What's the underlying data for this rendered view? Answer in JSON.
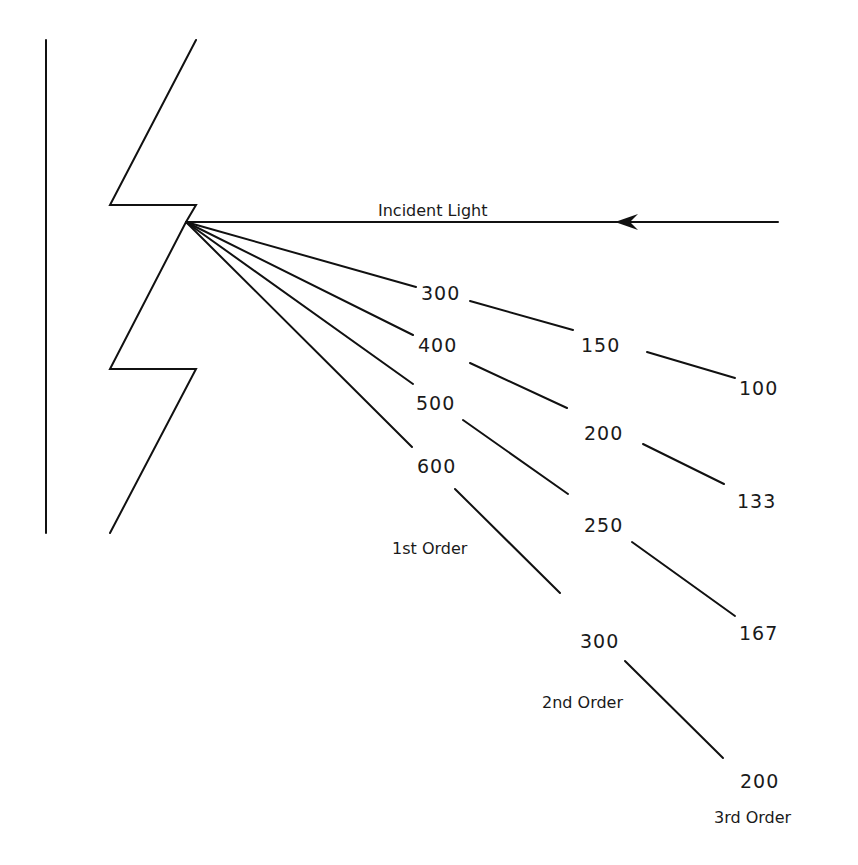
{
  "diagram": {
    "incident_label": "Incident Light",
    "first_order": {
      "label": "1st Order",
      "wavelengths": [
        "300",
        "400",
        "500",
        "600"
      ]
    },
    "second_order": {
      "label": "2nd Order",
      "wavelengths": [
        "150",
        "200",
        "250",
        "300"
      ]
    },
    "third_order": {
      "label": "3rd Order",
      "wavelengths": [
        "100",
        "133",
        "167",
        "200"
      ]
    },
    "colors": {
      "line": "#111111",
      "text": "#1a1a1a",
      "background": "#ffffff"
    }
  }
}
